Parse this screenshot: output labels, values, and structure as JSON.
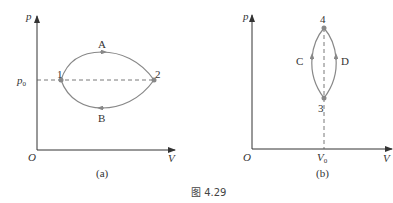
{
  "figure_caption": "图 4.29",
  "panels": {
    "a": {
      "label": "(a)",
      "axes": {
        "y": "p",
        "x": "V",
        "origin": "O"
      },
      "y_marker": {
        "symbol": "p",
        "sub": "0"
      },
      "points": [
        "1",
        "2"
      ],
      "paths": [
        "A",
        "B"
      ]
    },
    "b": {
      "label": "(b)",
      "axes": {
        "y": "p",
        "x": "V",
        "origin": "O"
      },
      "x_marker": {
        "symbol": "V",
        "sub": "0"
      },
      "points": [
        "3",
        "4"
      ],
      "paths": [
        "C",
        "D"
      ]
    }
  },
  "colors": {
    "curve": "#888888",
    "axis": "#333333",
    "point": "#888888"
  }
}
